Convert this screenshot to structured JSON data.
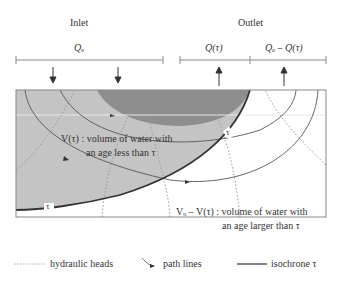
{
  "header": {
    "inlet_label": "Inlet",
    "outlet_label": "Outlet",
    "inlet_flow": "Qₒ",
    "outlet_flow_tau": "Q(τ)",
    "outlet_flow_rest": "Qₒ – Q(τ)"
  },
  "regions": {
    "young_label_line1": "V(τ) : volume of water with",
    "young_label_line2": "an age less than τ",
    "old_label_line1": "Vₒ – V(τ) : volume of water with",
    "old_label_line2": "an age larger than τ",
    "isochrone_tag_left": "τ",
    "isochrone_tag_right": "τ"
  },
  "legend": {
    "items": [
      {
        "symbol": "dotted-line",
        "label": "hydraulic heads"
      },
      {
        "symbol": "arrow-curve",
        "label": "path lines"
      },
      {
        "symbol": "solid-line",
        "label": "isochrone τ"
      }
    ]
  },
  "colors": {
    "light_gray_region": "#c4c4c4",
    "dark_gray_region": "#8e8e8e",
    "isochrone": "#333333",
    "hydraulic_heads": "#999999",
    "path_lines": "#555555",
    "frame": "#888888"
  }
}
